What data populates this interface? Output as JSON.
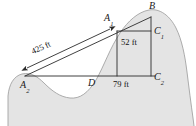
{
  "figure": {
    "type": "geometry-diagram",
    "background_color": "#ffffff",
    "terrain_fill_color": "#e3e3e3",
    "terrain_stroke_color": "#9a9a9a",
    "line_color": "#2b2b2b",
    "points": [
      {
        "id": "A1",
        "base": "A",
        "sub": "1",
        "x": 111,
        "y": 22
      },
      {
        "id": "B",
        "base": "B",
        "sub": "",
        "x": 152,
        "y": 11
      },
      {
        "id": "C1",
        "base": "C",
        "sub": "1",
        "x": 158,
        "y": 33
      },
      {
        "id": "C2",
        "base": "C",
        "sub": "2",
        "x": 158,
        "y": 79
      },
      {
        "id": "D",
        "base": "D",
        "sub": "",
        "x": 92,
        "y": 79
      },
      {
        "id": "A2",
        "base": "A",
        "sub": "2",
        "x": 24,
        "y": 79
      }
    ],
    "dimensions": [
      {
        "id": "distance",
        "text": "425 ft",
        "value": 425,
        "unit": "ft",
        "angle_deg": -21
      },
      {
        "id": "height",
        "text": "52 ft",
        "value": 52,
        "unit": "ft"
      },
      {
        "id": "base",
        "text": "79 ft",
        "value": 79,
        "unit": "ft"
      }
    ],
    "arrow": {
      "name": "double-headed-measurement-arrow",
      "from": "A2",
      "to": "A1",
      "double_headed": true
    }
  }
}
